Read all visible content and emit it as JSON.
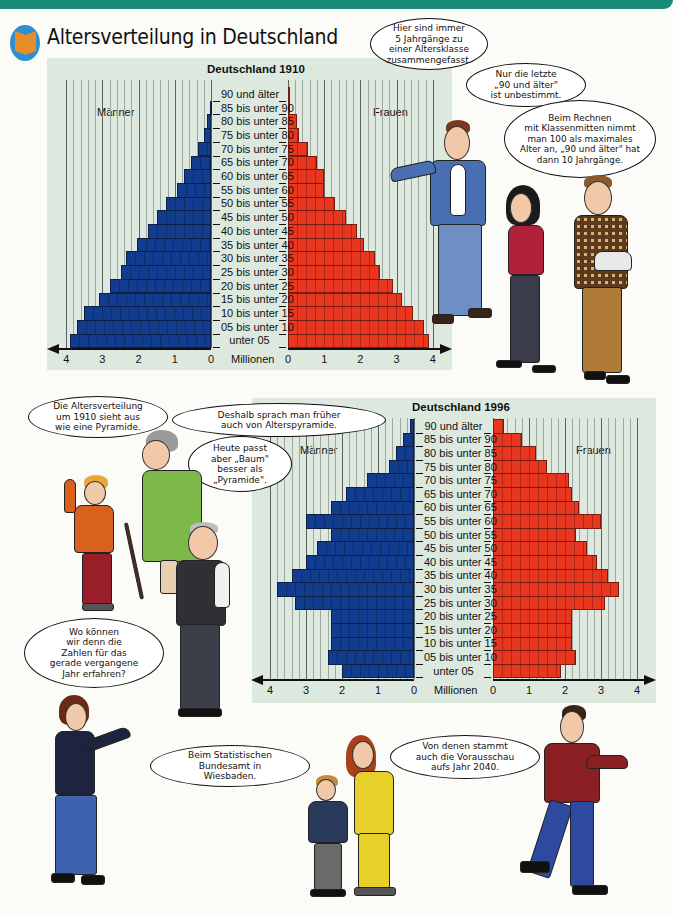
{
  "page": {
    "title": "Altersverteilung in Deutschland",
    "logo_icon": "book-icon",
    "colors": {
      "banner": "#1a8a7a",
      "chart_bg": "#dde9df",
      "male": "#123d8f",
      "female": "#e8361f"
    }
  },
  "age_groups": [
    "90 und älter",
    "85 bis unter 90",
    "80 bis unter 85",
    "75 bis unter 80",
    "70 bis unter 75",
    "65 bis unter 70",
    "60 bis unter 65",
    "55 bis unter 60",
    "50 bis unter 55",
    "45 bis unter 50",
    "40 bis unter 45",
    "35 bis unter 40",
    "30 bis unter 35",
    "25 bis unter 30",
    "20 bis unter 25",
    "15 bis unter 20",
    "10 bis unter 15",
    "05 bis unter 10",
    "unter 05"
  ],
  "chart_data": [
    {
      "type": "bar",
      "subtype": "population-pyramid",
      "title": "Deutschland 1910",
      "categories": [
        "90 und älter",
        "85 bis unter 90",
        "80 bis unter 85",
        "75 bis unter 80",
        "70 bis unter 75",
        "65 bis unter 70",
        "60 bis unter 65",
        "55 bis unter 60",
        "50 bis unter 55",
        "45 bis unter 50",
        "40 bis unter 45",
        "35 bis unter 40",
        "30 bis unter 35",
        "25 bis unter 30",
        "20 bis unter 25",
        "15 bis unter 20",
        "10 bis unter 15",
        "05 bis unter 10",
        "unter 05"
      ],
      "series": [
        {
          "name": "Männer",
          "values": [
            0.0,
            0.03,
            0.12,
            0.2,
            0.35,
            0.55,
            0.75,
            0.95,
            1.25,
            1.5,
            1.75,
            2.05,
            2.35,
            2.5,
            2.8,
            3.1,
            3.5,
            3.7,
            3.9
          ]
        },
        {
          "name": "Frauen",
          "values": [
            0.02,
            0.05,
            0.25,
            0.3,
            0.55,
            0.8,
            1.0,
            1.0,
            1.3,
            1.6,
            1.9,
            2.1,
            2.4,
            2.55,
            2.9,
            3.15,
            3.45,
            3.75,
            3.9
          ]
        }
      ],
      "xlabel": "Millionen",
      "xticks": [
        "4",
        "3",
        "2",
        "1",
        "0",
        "0",
        "1",
        "2",
        "3",
        "4"
      ],
      "xlim": [
        0,
        4
      ],
      "grid": true,
      "legend": [
        "Männer",
        "Frauen"
      ]
    },
    {
      "type": "bar",
      "subtype": "population-pyramid",
      "title": "Deutschland 1996",
      "categories": [
        "90 und älter",
        "85 bis unter 90",
        "80 bis unter 85",
        "75 bis unter 80",
        "70 bis unter 75",
        "65 bis unter 70",
        "60 bis unter 65",
        "55 bis unter 60",
        "50 bis unter 55",
        "45 bis unter 50",
        "40 bis unter 45",
        "35 bis unter 40",
        "30 bis unter 35",
        "25 bis unter 30",
        "20 bis unter 25",
        "15 bis unter 20",
        "10 bis unter 15",
        "05 bis unter 10",
        "unter 05"
      ],
      "series": [
        {
          "name": "Männer",
          "values": [
            0.1,
            0.3,
            0.5,
            0.7,
            1.3,
            1.9,
            2.3,
            3.0,
            2.3,
            2.7,
            3.0,
            3.4,
            3.8,
            3.3,
            2.3,
            2.3,
            2.3,
            2.4,
            2.0
          ]
        },
        {
          "name": "Frauen",
          "values": [
            0.3,
            0.8,
            1.2,
            1.5,
            2.1,
            2.2,
            2.4,
            3.0,
            2.3,
            2.6,
            2.9,
            3.2,
            3.5,
            3.1,
            2.2,
            2.2,
            2.2,
            2.3,
            1.9
          ]
        }
      ],
      "xlabel": "Millionen",
      "xticks": [
        "4",
        "3",
        "2",
        "1",
        "0",
        "0",
        "1",
        "2",
        "3",
        "4"
      ],
      "xlim": [
        0,
        4
      ],
      "grid": true,
      "legend": [
        "Männer",
        "Frauen"
      ]
    }
  ],
  "charts": {
    "c1910": {
      "title": "Deutschland 1910",
      "male_label": "Männer",
      "female_label": "Frauen",
      "unit": "Millionen"
    },
    "c1996": {
      "title": "Deutschland 1996",
      "male_label": "Männer",
      "female_label": "Frauen",
      "unit": "Millionen"
    }
  },
  "axis_numbers": [
    "4",
    "3",
    "2",
    "1",
    "0"
  ],
  "axis_numbers_right": [
    "0",
    "1",
    "2",
    "3",
    "4"
  ],
  "bubbles": {
    "b1": [
      "Hier sind immer",
      "5 Jahrgänge zu",
      "einer Altersklasse",
      "zusammengefasst."
    ],
    "b2": [
      "Nur die letzte",
      "„90 und älter\"",
      "ist unbestimmt."
    ],
    "b3": [
      "Beim Rechnen",
      "mit Klassenmitten nimmt",
      "man 100 als maximales",
      "Alter an, „90 und älter\" hat",
      "dann 10 Jahrgänge."
    ],
    "b4": [
      "Die Altersverteilung",
      "um 1910 sieht aus",
      "wie eine Pyramide."
    ],
    "b5": [
      "Deshalb sprach man früher",
      "auch von Alterspyramide."
    ],
    "b6": [
      "Heute passt",
      "aber „Baum\"",
      "besser als",
      "„Pyramide\"."
    ],
    "b7": [
      "Wo können",
      "wir denn die",
      "Zahlen für das",
      "gerade vergangene",
      "Jahr erfahren?"
    ],
    "b8": [
      "Beim Statistischen",
      "Bundesamt in",
      "Wiesbaden."
    ],
    "b9": [
      "Von denen stammt",
      "auch die Vorausschau",
      "aufs Jahr 2040."
    ]
  }
}
